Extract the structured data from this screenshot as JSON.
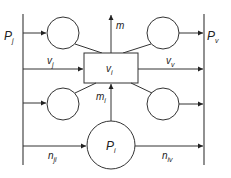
{
  "diagram": {
    "type": "flow-network",
    "labels": {
      "Pj": {
        "main": "P",
        "sub": "j"
      },
      "Pv": {
        "main": "P",
        "sub": "v"
      },
      "m": {
        "main": "m",
        "sub": ""
      },
      "vj": {
        "main": "v",
        "sub": "j"
      },
      "vv": {
        "main": "v",
        "sub": "v"
      },
      "vi": {
        "main": "v",
        "sub": "i"
      },
      "mi": {
        "main": "m",
        "sub": "i"
      },
      "Pi": {
        "main": "P",
        "sub": "i"
      },
      "nji": {
        "main": "n",
        "sub": "ji"
      },
      "niv": {
        "main": "n",
        "sub": "iv"
      }
    },
    "nodes": [
      {
        "id": "top-left-node",
        "shape": "circle"
      },
      {
        "id": "top-right-node",
        "shape": "circle"
      },
      {
        "id": "bottom-left-node",
        "shape": "circle"
      },
      {
        "id": "bottom-right-node",
        "shape": "circle"
      },
      {
        "id": "vi-box",
        "shape": "rect",
        "label": "vi"
      },
      {
        "id": "Pi-node",
        "shape": "circle",
        "label": "Pi"
      }
    ],
    "edges": [
      {
        "from": "Pj-line",
        "to": "top-left-node",
        "arrow": true
      },
      {
        "from": "top-left-node",
        "to": "vi-box",
        "arrow": false
      },
      {
        "from": "vi-box",
        "to": "top-right-node",
        "arrow": false
      },
      {
        "from": "top-right-node",
        "to": "Pv-line",
        "arrow": true
      },
      {
        "from": "Pj-line",
        "to": "vi-box",
        "label": "vj",
        "arrow": true
      },
      {
        "from": "vi-box",
        "to": "Pv-line",
        "label": "vv",
        "arrow": true
      },
      {
        "from": "vi-box",
        "to": "out",
        "label": "m",
        "arrow": true
      },
      {
        "from": "Pj-line",
        "to": "bottom-left-node",
        "arrow": true
      },
      {
        "from": "bottom-left-node",
        "to": "vi-box",
        "arrow": false
      },
      {
        "from": "vi-box",
        "to": "bottom-right-node",
        "arrow": false
      },
      {
        "from": "bottom-right-node",
        "to": "Pv-line",
        "arrow": true
      },
      {
        "from": "Pi-node",
        "to": "vi-box",
        "label": "mi",
        "arrow": true
      },
      {
        "from": "Pj-line",
        "to": "Pi-node",
        "label": "nji",
        "arrow": true
      },
      {
        "from": "Pi-node",
        "to": "Pv-line",
        "label": "niv",
        "arrow": false
      }
    ]
  }
}
